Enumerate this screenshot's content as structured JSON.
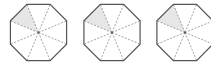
{
  "figure": {
    "colors": {
      "outline": "#555555",
      "dash": "#8a8a8a",
      "shade": "#e6e6e6",
      "background": "#ffffff"
    },
    "octagons": [
      {
        "cx": 38.5,
        "cy": 32.5,
        "r": 32,
        "sectors": 8,
        "shaded_sectors": [
          7
        ]
      },
      {
        "cx": 112,
        "cy": 32.5,
        "r": 32,
        "sectors": 8,
        "shaded_sectors": [
          7
        ]
      },
      {
        "cx": 185,
        "cy": 32.5,
        "r": 32,
        "sectors": 8,
        "shaded_sectors": [
          7
        ]
      }
    ]
  }
}
